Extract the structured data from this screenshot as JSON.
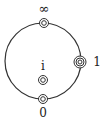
{
  "diagram": {
    "type": "circle-with-marked-points",
    "circle": {
      "cx": 43,
      "cy": 61,
      "r": 38,
      "stroke": "#333333"
    },
    "points": [
      {
        "id": "infinity",
        "label": "∞",
        "x": 44,
        "y": 23,
        "rings": 2,
        "label_x": 44,
        "label_y": 13
      },
      {
        "id": "one",
        "label": "1",
        "x": 80,
        "y": 62,
        "rings": 3,
        "label_x": 97,
        "label_y": 66
      },
      {
        "id": "i",
        "label": "i",
        "x": 43,
        "y": 80,
        "rings": 2,
        "label_x": 43,
        "label_y": 70
      },
      {
        "id": "zero",
        "label": "0",
        "x": 43,
        "y": 99,
        "rings": 2,
        "label_x": 43,
        "label_y": 117
      }
    ]
  },
  "labels": {
    "infinity": "∞",
    "one": "1",
    "i": "i",
    "zero": "0"
  }
}
